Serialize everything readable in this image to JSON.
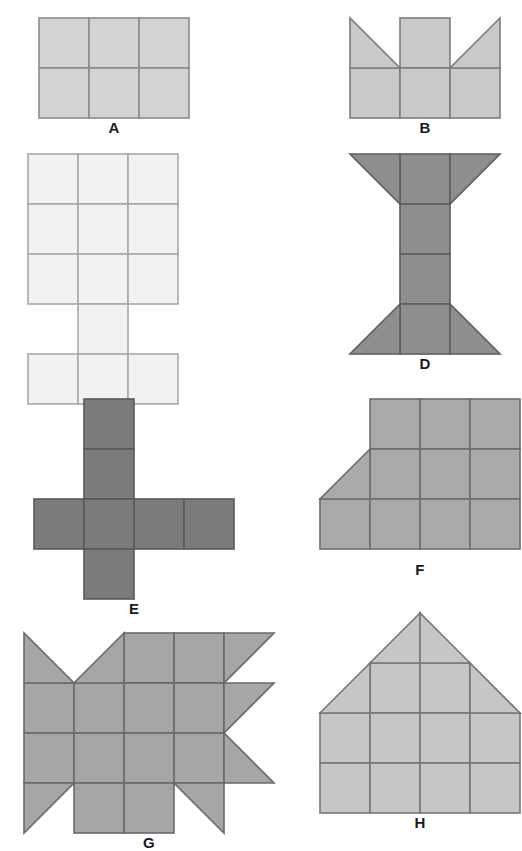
{
  "sheet": {
    "title": "Polyform figure set",
    "background_color": "#ffffff",
    "width": 499,
    "height": 786,
    "columns": 2,
    "rows": 4,
    "cell_size": 50,
    "stroke_color": "#666666",
    "stroke_width": 1.6
  },
  "figures": [
    {
      "id": "A",
      "label": "A",
      "name": "rectangle-3x2",
      "fill": "#d3d3d3",
      "stroke": "#8c8c8c",
      "cols": 3,
      "rows": 2,
      "x": 37,
      "y": 16,
      "label_y": 104,
      "squares": [
        [
          0,
          0
        ],
        [
          1,
          0
        ],
        [
          2,
          0
        ],
        [
          0,
          1
        ],
        [
          1,
          1
        ],
        [
          2,
          1
        ]
      ],
      "triangles": []
    },
    {
      "id": "B",
      "label": "B",
      "name": "crown-with-two-triangles",
      "fill": "#c9c9c9",
      "stroke": "#7d7d7d",
      "cols": 3,
      "rows": 2,
      "x": 348,
      "y": 16,
      "label_y": 104,
      "squares": [
        [
          1,
          0
        ],
        [
          0,
          1
        ],
        [
          1,
          1
        ],
        [
          2,
          1
        ]
      ],
      "triangles": [
        {
          "col": 0,
          "row": 0,
          "corners": "tl-bl-br"
        },
        {
          "col": 2,
          "row": 0,
          "corners": "tr-bl-br"
        }
      ]
    },
    {
      "id": "C",
      "label": "C",
      "name": "notched-column-grid",
      "fill": "#f2f2f2",
      "stroke": "#a8a8a8",
      "cols": 3,
      "rows": 5,
      "x": 26,
      "y": 152,
      "label_y": 330,
      "squares": [
        [
          0,
          0
        ],
        [
          1,
          0
        ],
        [
          2,
          0
        ],
        [
          0,
          1
        ],
        [
          1,
          1
        ],
        [
          2,
          1
        ],
        [
          0,
          2
        ],
        [
          1,
          2
        ],
        [
          2,
          2
        ],
        [
          1,
          3
        ],
        [
          0,
          4
        ],
        [
          1,
          4
        ],
        [
          2,
          4
        ]
      ],
      "triangles": []
    },
    {
      "id": "D",
      "label": "D",
      "name": "i-beam-hourglass",
      "fill": "#8e8e8e",
      "stroke": "#5e5e5e",
      "cols": 3,
      "rows": 4,
      "x": 348,
      "y": 152,
      "label_y": 330,
      "squares": [
        [
          1,
          0
        ],
        [
          1,
          1
        ],
        [
          1,
          2
        ],
        [
          1,
          3
        ]
      ],
      "triangles": [
        {
          "col": 0,
          "row": 0,
          "corners": "tl-tr-br"
        },
        {
          "col": 2,
          "row": 0,
          "corners": "tl-tr-bl"
        },
        {
          "col": 0,
          "row": 3,
          "corners": "tr-bl-br"
        },
        {
          "col": 2,
          "row": 3,
          "corners": "tl-bl-br"
        }
      ]
    },
    {
      "id": "E",
      "label": "E",
      "name": "cross-cube-net",
      "fill": "#7b7b7b",
      "stroke": "#5a5a5a",
      "cols": 4,
      "rows": 4,
      "x": 32,
      "y": 397,
      "label_y": 562,
      "squares": [
        [
          1,
          0
        ],
        [
          1,
          1
        ],
        [
          0,
          2
        ],
        [
          1,
          2
        ],
        [
          2,
          2
        ],
        [
          3,
          2
        ],
        [
          1,
          3
        ]
      ],
      "triangles": []
    },
    {
      "id": "F",
      "label": "F",
      "name": "stepped-ramp-quadrilateral",
      "fill": "#a9a9a9",
      "stroke": "#6d6d6d",
      "cols": 4,
      "rows": 3,
      "x": 318,
      "y": 397,
      "label_y": 562,
      "squares": [
        [
          1,
          0
        ],
        [
          2,
          0
        ],
        [
          3,
          0
        ],
        [
          1,
          1
        ],
        [
          2,
          1
        ],
        [
          3,
          1
        ],
        [
          0,
          2
        ],
        [
          1,
          2
        ],
        [
          2,
          2
        ],
        [
          3,
          2
        ]
      ],
      "triangles": [
        {
          "col": 0,
          "row": 1,
          "corners": "tr-bl-br"
        }
      ]
    },
    {
      "id": "G",
      "label": "G",
      "name": "arrow-fish-polyform",
      "fill": "#a6a6a6",
      "stroke": "#6a6a6a",
      "cols": 5,
      "rows": 4,
      "x": 22,
      "y": 631,
      "label_y": 757,
      "squares": [
        [
          2,
          0
        ],
        [
          3,
          0
        ],
        [
          0,
          1
        ],
        [
          1,
          1
        ],
        [
          2,
          1
        ],
        [
          3,
          1
        ],
        [
          0,
          2
        ],
        [
          1,
          2
        ],
        [
          2,
          2
        ],
        [
          3,
          2
        ],
        [
          1,
          3
        ],
        [
          2,
          3
        ]
      ],
      "triangles": [
        {
          "col": 0,
          "row": 0,
          "corners": "tl-bl-br"
        },
        {
          "col": 1,
          "row": 0,
          "corners": "tr-bl-br"
        },
        {
          "col": 4,
          "row": 0,
          "corners": "tl-tr-bl"
        },
        {
          "col": 4,
          "row": 1,
          "corners": "tl-tr-bl"
        },
        {
          "col": 4,
          "row": 2,
          "corners": "tl-bl-br"
        },
        {
          "col": 0,
          "row": 3,
          "corners": "tl-tr-bl"
        },
        {
          "col": 3,
          "row": 3,
          "corners": "tl-tr-br"
        }
      ]
    },
    {
      "id": "H",
      "label": "H",
      "name": "house-pentagon",
      "fill": "#c6c6c6",
      "stroke": "#777777",
      "cols": 4,
      "rows": 4,
      "x": 318,
      "y": 611,
      "label_y": 757,
      "squares": [
        [
          1,
          1
        ],
        [
          2,
          1
        ],
        [
          0,
          2
        ],
        [
          1,
          2
        ],
        [
          2,
          2
        ],
        [
          3,
          2
        ],
        [
          0,
          3
        ],
        [
          1,
          3
        ],
        [
          2,
          3
        ],
        [
          3,
          3
        ]
      ],
      "triangles": [
        {
          "col": 1,
          "row": 0,
          "corners": "tr-bl-br"
        },
        {
          "col": 2,
          "row": 0,
          "corners": "tl-bl-br"
        },
        {
          "col": 0,
          "row": 1,
          "corners": "tr-bl-br"
        },
        {
          "col": 3,
          "row": 1,
          "corners": "tl-bl-br"
        }
      ]
    }
  ]
}
